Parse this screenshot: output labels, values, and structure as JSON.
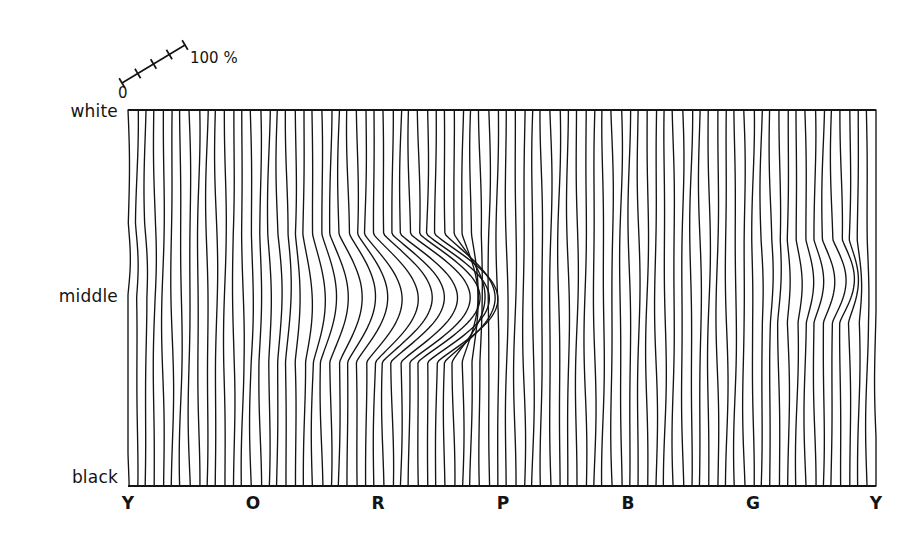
{
  "figure": {
    "background_color": "#ffffff",
    "ink_color": "#141414",
    "plot_area": {
      "left": 128,
      "top": 110,
      "right": 876,
      "bottom": 486
    }
  },
  "y_axis": {
    "name": "lightness",
    "labels": [
      {
        "text": "white",
        "y": 112
      },
      {
        "text": "middle",
        "y": 297
      },
      {
        "text": "black",
        "y": 478
      }
    ]
  },
  "x_axis": {
    "name": "hue",
    "labels": [
      {
        "text": "Y",
        "x": 128
      },
      {
        "text": "O",
        "x": 253
      },
      {
        "text": "R",
        "x": 378
      },
      {
        "text": "P",
        "x": 503
      },
      {
        "text": "B",
        "x": 628
      },
      {
        "text": "G",
        "x": 753
      },
      {
        "text": "Y",
        "x": 876
      }
    ],
    "label_y": 503
  },
  "scale_bar": {
    "start_label": "0",
    "end_label": "100 %",
    "tick_count": 5,
    "x1": 122,
    "y1": 83,
    "x2": 185,
    "y2": 45
  },
  "chart_data": {
    "type": "line",
    "title": "",
    "xlabel": "hue",
    "ylabel": "lightness",
    "grid": false,
    "legend": "scale bar, 0 to 100 %",
    "xlim": [
      0,
      1
    ],
    "ylim": [
      0,
      1
    ],
    "x_tick_labels": [
      "Y",
      "O",
      "R",
      "P",
      "B",
      "G",
      "Y"
    ],
    "y_tick_labels": [
      "white",
      "middle",
      "black"
    ],
    "n_lines": 86,
    "line_color": "#141414",
    "line_width": 1.35,
    "folds": [
      {
        "name": "red-fold",
        "center_x": 0.405,
        "center_y": 0.5,
        "edge_x": 0.415,
        "amplitude": 0.085,
        "sigma": 0.085,
        "cusp_upper_y": 0.315,
        "cusp_lower_y": 0.655,
        "strength": 1.0
      },
      {
        "name": "yellow-fold",
        "center_x": 0.955,
        "center_y": 0.455,
        "edge_x": 0.962,
        "amplitude": 0.036,
        "sigma": 0.045,
        "cusp_upper_y": 0.345,
        "cusp_lower_y": 0.565,
        "strength": 0.5
      },
      {
        "name": "left-edge-bulge",
        "center_x": 0.004,
        "center_y": 0.4,
        "edge_x": 0.0,
        "amplitude": 0.012,
        "sigma": 0.05,
        "cusp_upper_y": 0.3,
        "cusp_lower_y": 0.5,
        "strength": 0.3
      }
    ]
  }
}
